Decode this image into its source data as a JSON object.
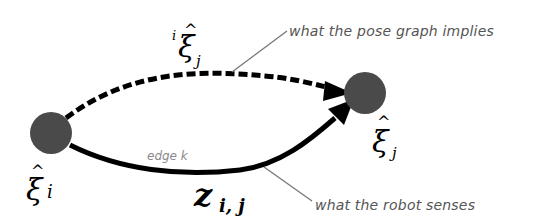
{
  "diagram": {
    "type": "pose-graph-edge",
    "colors": {
      "node": "#4a4a4a",
      "edge": "#000000",
      "annotation_text": "#555555",
      "annotation_line": "#777777",
      "edge_label": "#8a8a8a"
    },
    "nodes": [
      {
        "id": "i",
        "label_base": "ξ",
        "label_hat": "^",
        "label_sub": "i"
      },
      {
        "id": "j",
        "label_base": "ξ",
        "label_hat": "^",
        "label_sub": "j"
      }
    ],
    "edges": [
      {
        "id": "implied",
        "style": "dashed",
        "label_pre": "i",
        "label_base": "ξ",
        "label_hat": "^",
        "label_sub": "j",
        "annotation": "what the pose graph implies"
      },
      {
        "id": "measured",
        "style": "solid",
        "label_base": "z",
        "label_sub": "i, j",
        "edge_name": "edge k",
        "annotation": "what the robot senses"
      }
    ]
  }
}
